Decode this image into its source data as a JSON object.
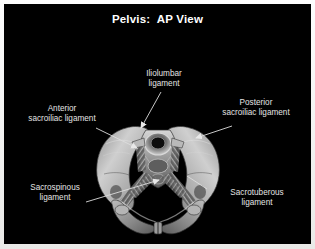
{
  "window": {
    "background_color": "#f2f2f0",
    "stage_color": "#000000"
  },
  "header": {
    "title": "Pelvis:  AP View",
    "title_color": "#ffffff"
  },
  "figure": {
    "rendering": "grayscale-3d-bone-model",
    "label_color": "#e4e4e4",
    "leader_color": "#d8d8d8"
  },
  "annotations": [
    {
      "id": "iliolumbar",
      "line1": "Iliolumbar",
      "line2": "ligament",
      "position": "top-center"
    },
    {
      "id": "anterior-sacroiliac",
      "line1": "Anterior",
      "line2": "sacroiliac ligament",
      "position": "left-upper"
    },
    {
      "id": "posterior-sacroiliac",
      "line1": "Posterior",
      "line2": "sacroiliac ligament",
      "position": "right-upper"
    },
    {
      "id": "sacrospinous",
      "line1": "Sacrospinous",
      "line2": "ligament",
      "position": "left-lower"
    },
    {
      "id": "sacrotuberous",
      "line1": "Sacrotuberous",
      "line2": "ligament",
      "position": "right-lower"
    }
  ]
}
